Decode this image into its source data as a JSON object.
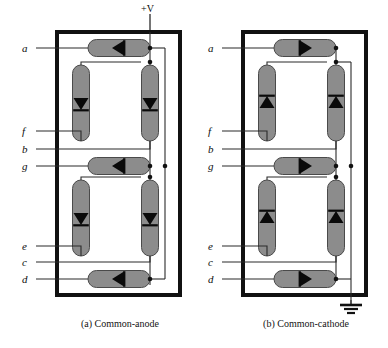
{
  "figure": {
    "colors": {
      "led_body": "#8c8c8c",
      "led_outline": "#4d4d4d",
      "package_outline": "#111111",
      "wire": "#2b2b2b",
      "background": "#ffffff",
      "text": "#0d0d0d"
    }
  },
  "panels": [
    {
      "id": "a",
      "caption": "(a) Common-anode",
      "supply": {
        "label": "+V",
        "type": "positive-supply",
        "present": true
      },
      "ground": {
        "label": "",
        "type": "ground",
        "present": false
      },
      "pins": [
        {
          "name": "a",
          "label": "a",
          "y": 48
        },
        {
          "name": "f",
          "label": "f",
          "y": 131
        },
        {
          "name": "b",
          "label": "b",
          "y": 149
        },
        {
          "name": "g",
          "label": "g",
          "y": 166
        },
        {
          "name": "e",
          "label": "e",
          "y": 246
        },
        {
          "name": "c",
          "label": "c",
          "y": 262
        },
        {
          "name": "d",
          "label": "d",
          "y": 279
        }
      ],
      "segments": [
        {
          "name": "a",
          "orientation": "horizontal",
          "arrow": "left"
        },
        {
          "name": "f",
          "orientation": "vertical",
          "arrow": "down"
        },
        {
          "name": "b",
          "orientation": "vertical",
          "arrow": "down"
        },
        {
          "name": "g",
          "orientation": "horizontal",
          "arrow": "left"
        },
        {
          "name": "e",
          "orientation": "vertical",
          "arrow": "down"
        },
        {
          "name": "c",
          "orientation": "vertical",
          "arrow": "down"
        },
        {
          "name": "d",
          "orientation": "horizontal",
          "arrow": "left"
        }
      ]
    },
    {
      "id": "b",
      "caption": "(b) Common-cathode",
      "supply": {
        "label": "",
        "type": "positive-supply",
        "present": false
      },
      "ground": {
        "label": "",
        "type": "ground",
        "present": true
      },
      "pins": [
        {
          "name": "a",
          "label": "a",
          "y": 48
        },
        {
          "name": "f",
          "label": "f",
          "y": 131
        },
        {
          "name": "b",
          "label": "b",
          "y": 149
        },
        {
          "name": "g",
          "label": "g",
          "y": 166
        },
        {
          "name": "e",
          "label": "e",
          "y": 246
        },
        {
          "name": "c",
          "label": "c",
          "y": 262
        },
        {
          "name": "d",
          "label": "d",
          "y": 279
        }
      ],
      "segments": [
        {
          "name": "a",
          "orientation": "horizontal",
          "arrow": "right"
        },
        {
          "name": "f",
          "orientation": "vertical",
          "arrow": "up"
        },
        {
          "name": "b",
          "orientation": "vertical",
          "arrow": "up"
        },
        {
          "name": "g",
          "orientation": "horizontal",
          "arrow": "right"
        },
        {
          "name": "e",
          "orientation": "vertical",
          "arrow": "up"
        },
        {
          "name": "c",
          "orientation": "vertical",
          "arrow": "up"
        },
        {
          "name": "d",
          "orientation": "horizontal",
          "arrow": "right"
        }
      ]
    }
  ]
}
